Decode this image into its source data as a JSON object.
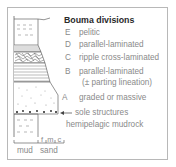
{
  "title": "Bouma divisions",
  "divisions": [
    {
      "letter": "E",
      "label": "pelitic"
    },
    {
      "letter": "D",
      "label": "parallel-laminated"
    },
    {
      "letter": "C",
      "label": "ripple cross-laminated"
    },
    {
      "letter": "B",
      "label": "parallel-laminated",
      "label2": "(± parting lineation)"
    },
    {
      "letter": "A",
      "label": "graded or massive"
    }
  ],
  "annotations": {
    "sole": "sole structures",
    "hemipelagic": "hemipelagic mudrock"
  },
  "scale": {
    "grain_ticks": "f m c",
    "mud": "mud",
    "sand": "sand"
  },
  "colors": {
    "line": "#555555",
    "text": "#8a8a8a",
    "title": "#2a2a2a"
  }
}
